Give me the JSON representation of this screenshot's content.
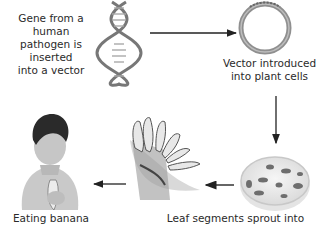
{
  "diagram": {
    "steps": [
      {
        "id": "gene",
        "label_lines": [
          "Gene from a human",
          "pathogen is inserted",
          "into a vector"
        ],
        "icon": "dna-double-helix"
      },
      {
        "id": "vector",
        "label_lines": [
          "Vector introduced",
          "into plant cells"
        ],
        "icon": "plasmid-ring"
      },
      {
        "id": "petri",
        "label_lines": [],
        "icon": "petri-dish-with-leaf-segments"
      },
      {
        "id": "plant",
        "label_lines": [
          "Leaf segments sprout into"
        ],
        "icon": "banana-plant"
      },
      {
        "id": "child",
        "label_lines": [
          "Eating banana"
        ],
        "icon": "child-eating-banana"
      }
    ],
    "arrows": [
      {
        "from": "gene",
        "to": "vector",
        "direction": "right"
      },
      {
        "from": "vector",
        "to": "petri",
        "direction": "down"
      },
      {
        "from": "petri",
        "to": "plant",
        "direction": "left"
      },
      {
        "from": "plant",
        "to": "child",
        "direction": "left"
      }
    ],
    "colors": {
      "ring": "#8f8f8f",
      "arrow": "#222222",
      "text": "#2a2a2a"
    }
  }
}
